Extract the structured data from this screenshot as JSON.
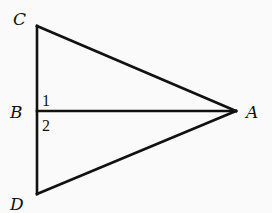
{
  "diagram": {
    "type": "geometry",
    "points": {
      "C": {
        "label": "C",
        "x": 36,
        "y": 26
      },
      "B": {
        "label": "B",
        "x": 36,
        "y": 111
      },
      "D": {
        "label": "D",
        "x": 36,
        "y": 194
      },
      "A": {
        "label": "A",
        "x": 236,
        "y": 111
      }
    },
    "segments": [
      "CD",
      "CA",
      "DA",
      "BA"
    ],
    "angle_labels": [
      {
        "label": "1",
        "at": "B",
        "between": [
          "BC",
          "BA"
        ]
      },
      {
        "label": "2",
        "at": "B",
        "between": [
          "BA",
          "BD"
        ]
      }
    ],
    "colors": {
      "stroke": "#111111",
      "background": "#fafafa"
    }
  }
}
